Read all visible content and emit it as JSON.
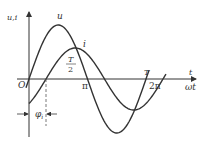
{
  "diagram": {
    "type": "sinusoidal-phase-diagram",
    "axes": {
      "y_label": "u,i",
      "x_label_top": "t",
      "x_label_bottom": "ωt",
      "origin_label": "O"
    },
    "curves": [
      {
        "name": "u",
        "label": "u",
        "amplitude_px": 54,
        "phase_px": 0
      },
      {
        "name": "i",
        "label": "i",
        "amplitude_px": 31,
        "phase_px": 17
      }
    ],
    "ticks": {
      "half_period_top_num": "T",
      "half_period_top_den": "2",
      "half_period_bottom": "π",
      "full_period_top": "T",
      "full_period_bottom": "2π"
    },
    "phase_annotation": {
      "symbol": "φ",
      "subscript": "i"
    },
    "colors": {
      "stroke": "#333333",
      "background": "#ffffff"
    }
  }
}
